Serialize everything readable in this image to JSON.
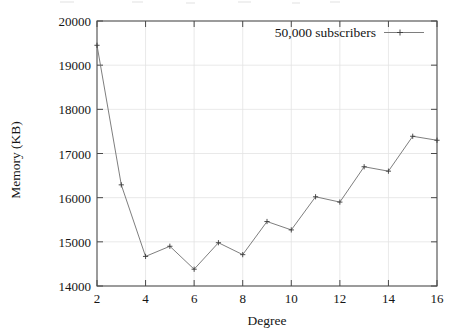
{
  "chart_data": {
    "type": "line",
    "title": "",
    "subtitle": "",
    "xlabel": "Degree",
    "ylabel": "Memory (KB)",
    "xlim": [
      2,
      16
    ],
    "ylim": [
      14000,
      20000
    ],
    "xticks": [
      2,
      4,
      6,
      8,
      10,
      12,
      14,
      16
    ],
    "yticks": [
      14000,
      15000,
      16000,
      17000,
      18000,
      19000,
      20000
    ],
    "xtick_labels": [
      "2",
      "4",
      "6",
      "8",
      "10",
      "12",
      "14",
      "16"
    ],
    "ytick_labels": [
      "14000",
      "15000",
      "16000",
      "17000",
      "18000",
      "19000",
      "20000"
    ],
    "grid": true,
    "legend_position": "top-right",
    "series": [
      {
        "name": "50,000 subscribers",
        "marker": "plus",
        "color": "#6f6f6f",
        "x": [
          2,
          3,
          4,
          5,
          6,
          7,
          8,
          9,
          10,
          11,
          12,
          13,
          14,
          15,
          16
        ],
        "values": [
          19450,
          16290,
          14670,
          14900,
          14380,
          14980,
          14710,
          15460,
          15270,
          16020,
          15900,
          16700,
          16600,
          17390,
          17300
        ]
      }
    ]
  },
  "figure": {
    "legend": {
      "entries": [
        {
          "label": "50,000 subscribers"
        }
      ]
    },
    "axes": {
      "x": {
        "title": "Degree",
        "ticks": [
          "2",
          "4",
          "6",
          "8",
          "10",
          "12",
          "14",
          "16"
        ]
      },
      "y": {
        "title": "Memory (KB)",
        "ticks": [
          "20000",
          "19000",
          "18000",
          "17000",
          "16000",
          "15000",
          "14000"
        ]
      }
    }
  }
}
